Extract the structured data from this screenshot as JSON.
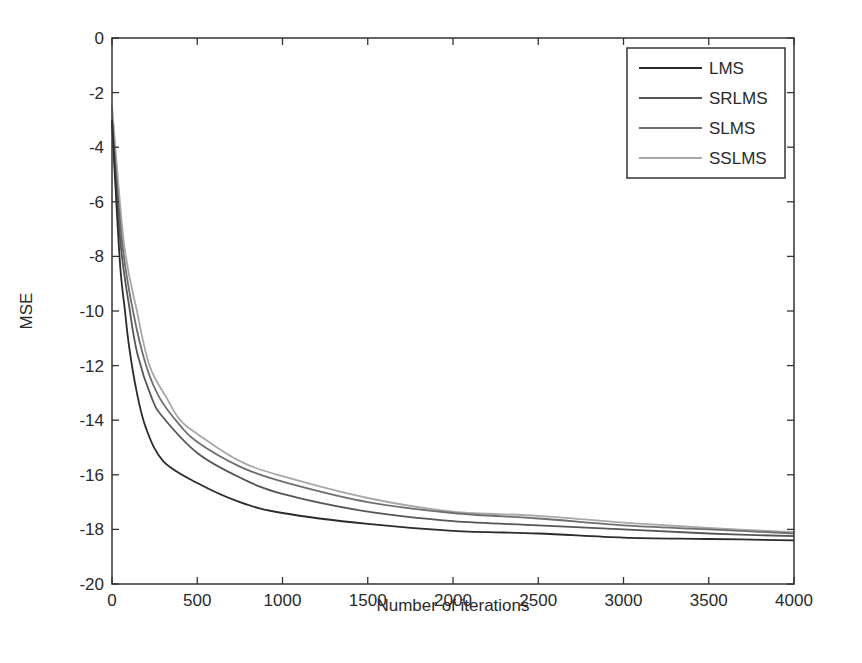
{
  "chart_data": {
    "type": "line",
    "title": "",
    "xlabel": "Number of iterations",
    "ylabel": "MSE",
    "xlim": [
      0,
      4000
    ],
    "ylim": [
      -20,
      0
    ],
    "xticks": [
      0,
      500,
      1000,
      1500,
      2000,
      2500,
      3000,
      3500,
      4000
    ],
    "yticks": [
      0,
      -2,
      -4,
      -6,
      -8,
      -10,
      -12,
      -14,
      -16,
      -18,
      -20
    ],
    "grid": false,
    "legend_position": "upper right",
    "series": [
      {
        "name": "LMS",
        "color": "#2b2b2b",
        "x": [
          0,
          25,
          50,
          76,
          100,
          146,
          200,
          300,
          500,
          750,
          1000,
          1500,
          2000,
          2500,
          3000,
          3500,
          4000
        ],
        "values": [
          -3,
          -6,
          -8.5,
          -10,
          -11.3,
          -13,
          -14.3,
          -15.5,
          -16.3,
          -17,
          -17.4,
          -17.8,
          -18.05,
          -18.15,
          -18.3,
          -18.35,
          -18.4
        ]
      },
      {
        "name": "SRLMS",
        "color": "#555555",
        "x": [
          0,
          50,
          105,
          150,
          234,
          300,
          500,
          750,
          1000,
          1500,
          2000,
          2500,
          3000,
          3500,
          4000
        ],
        "values": [
          -3,
          -7.5,
          -10,
          -11.6,
          -13.2,
          -13.9,
          -15.2,
          -16.1,
          -16.7,
          -17.35,
          -17.7,
          -17.85,
          -18.0,
          -18.15,
          -18.25
        ]
      },
      {
        "name": "SLMS",
        "color": "#6e6e6e",
        "x": [
          0,
          60,
          123,
          200,
          281,
          400,
          500,
          750,
          1000,
          1500,
          2000,
          2500,
          3000,
          3500,
          4000
        ],
        "values": [
          -3,
          -7.5,
          -10,
          -12,
          -13.2,
          -14.2,
          -14.8,
          -15.7,
          -16.25,
          -17.0,
          -17.4,
          -17.6,
          -17.85,
          -18.0,
          -18.15
        ]
      },
      {
        "name": "SSLMS",
        "color": "#a8a8a8",
        "x": [
          0,
          70,
          146,
          220,
          322,
          400,
          500,
          750,
          1000,
          1500,
          2000,
          2500,
          3000,
          3500,
          4000
        ],
        "values": [
          -2.5,
          -7.5,
          -10,
          -12,
          -13.2,
          -14.0,
          -14.5,
          -15.5,
          -16.05,
          -16.85,
          -17.35,
          -17.5,
          -17.75,
          -17.95,
          -18.1
        ]
      }
    ]
  }
}
